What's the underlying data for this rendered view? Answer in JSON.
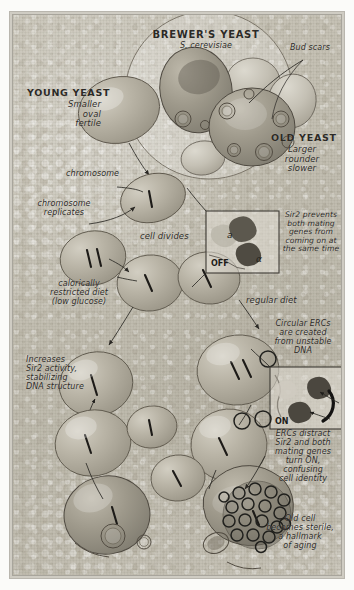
{
  "poster": {
    "domain": "scientific-illustration",
    "subject": "Yeast aging / Sir2 / ERCs hand-drawn diagram",
    "palette": {
      "paper": "#c5c1b5",
      "ink": "#2c2a26",
      "cell_fill": "#b6b1a3",
      "cell_stroke": "#5e584c",
      "frame": "#a8a59c",
      "erc_ring": "#20201d"
    }
  },
  "labels": {
    "title": "BREWER'S YEAST",
    "species": "S. cerevisiae",
    "bud_scars": "Bud scars",
    "young_yeast_head": "YOUNG YEAST",
    "young_yeast_body": "Smaller\noval\nfertile",
    "old_yeast_head": "OLD YEAST",
    "old_yeast_body": "Larger\nrounder\nslower",
    "chromosome": "chromosome",
    "chromosome_replicates": "chromosome\nreplicates",
    "cell_divides": "cell divides",
    "calorie_restricted": "calorically\nrestricted diet\n(low glucose)",
    "regular_diet": "regular diet",
    "sir2_prevents": "Sir2 prevents\nboth mating\ngenes from\ncoming on at\nthe same time",
    "increases_sir2": "Increases\nSir2 activity,\nstabilizing\nDNA structure",
    "circular_ercs": "Circular ERCs\nare created\nfrom unstable\nDNA",
    "ercs_distract": "ERCs distract\nSir2 and both\nmating genes\nturn ON,\nconfusing\ncell identity",
    "old_cell_sterile": "Old cell\nbecomes sterile,\na hallmark\nof aging"
  },
  "insets": {
    "off_panel": {
      "state": "OFF",
      "gene_a": "a",
      "gene_alpha": "α"
    },
    "on_panel": {
      "state": "ON"
    }
  }
}
